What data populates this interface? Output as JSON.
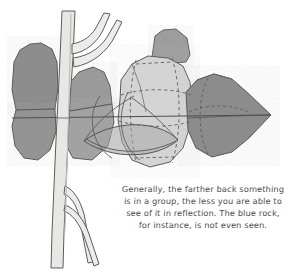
{
  "illustration": {
    "title": "rocks-in-group-reflection-sketch",
    "medium": "pencil and ink drawing",
    "palette": {
      "paper": "#ffffff",
      "ink_outline": "#5a5a5a",
      "rock_dark": "#8e8e8e",
      "rock_mid": "#a6a6a6",
      "rock_light": "#cfcfcf",
      "rock_pale": "#dddddd",
      "trunk_fill": "#e6e6e4",
      "dashed_line": "#6b6b6b",
      "caption_text": "#4a4a4a"
    },
    "elements": {
      "tree_trunk": "tree-trunk-with-branches",
      "rock_back_left": "dark-gray-rock-back-left",
      "rock_mid_left": "mid-gray-rock-left",
      "rock_center": "pale-gray-rock-center",
      "rock_back_top": "gray-rock-top-back",
      "rock_front_right": "dark-gray-rock-front-right",
      "reflection_lens": "reflection-lens-shape",
      "waterline": "horizontal-waterline",
      "construction_lines": "dashed-construction-lines"
    }
  },
  "caption": {
    "lines": [
      "Generally, the farther back something",
      "is in a group, the less you are able to",
      "see of it in reflection. The blue rock,",
      "for instance, is not even seen."
    ],
    "line1": "Generally, the farther back something",
    "line2": "is in a group, the less you are able to",
    "line3": "see of it in reflection. The blue rock,",
    "line4": "for instance, is not even seen."
  }
}
